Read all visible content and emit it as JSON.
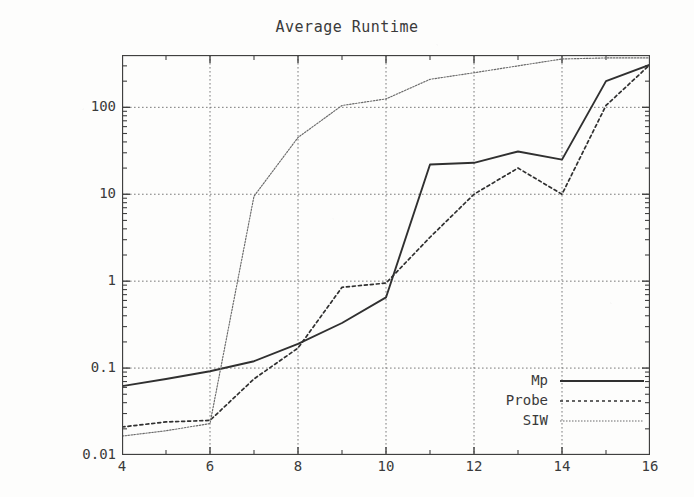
{
  "chart_data": {
    "type": "line",
    "title": "Average Runtime",
    "xlabel": "Number of Joints",
    "ylabel": "CPU-time Seconds",
    "yscale": "log",
    "xscale": "linear",
    "xlim": [
      4,
      16
    ],
    "ylim": [
      0.01,
      400
    ],
    "grid": true,
    "grid_style": "dotted",
    "legend_position": "bottom-right",
    "x_ticks": [
      "4",
      "6",
      "8",
      "10",
      "12",
      "14",
      "16"
    ],
    "x_tick_values": [
      4,
      6,
      8,
      10,
      12,
      14,
      16
    ],
    "y_ticks": [
      "0.01",
      "0.1",
      "1",
      "10",
      "100"
    ],
    "y_tick_values": [
      0.01,
      0.1,
      1,
      10,
      100
    ],
    "x": [
      4,
      5,
      6,
      7,
      8,
      9,
      10,
      11,
      12,
      13,
      14,
      15,
      16
    ],
    "series": [
      {
        "name": "Mp",
        "style": "solid",
        "color": "#303030",
        "values": [
          0.062,
          0.075,
          0.092,
          0.12,
          0.19,
          0.33,
          0.65,
          22,
          23,
          31,
          25,
          200,
          310
        ]
      },
      {
        "name": "Probe",
        "style": "dotted",
        "color": "#303030",
        "values": [
          0.021,
          0.024,
          0.025,
          0.075,
          0.17,
          0.85,
          0.95,
          3.2,
          10,
          20,
          10,
          105,
          310
        ]
      },
      {
        "name": "SIW",
        "style": "fine-dotted",
        "color": "#6a6a6a",
        "values": [
          0.0165,
          0.019,
          0.023,
          9.5,
          45,
          105,
          125,
          210,
          250,
          300,
          360,
          370,
          370
        ]
      }
    ]
  },
  "legend": {
    "entries": [
      {
        "label": "Mp",
        "style": "solid"
      },
      {
        "label": "Probe",
        "style": "dotted"
      },
      {
        "label": "SIW",
        "style": "fine-dotted"
      }
    ]
  },
  "colors": {
    "background": "#fdfdfc",
    "axis": "#404040",
    "grid": "#7a7a7a",
    "text": "#3a3a3a"
  }
}
